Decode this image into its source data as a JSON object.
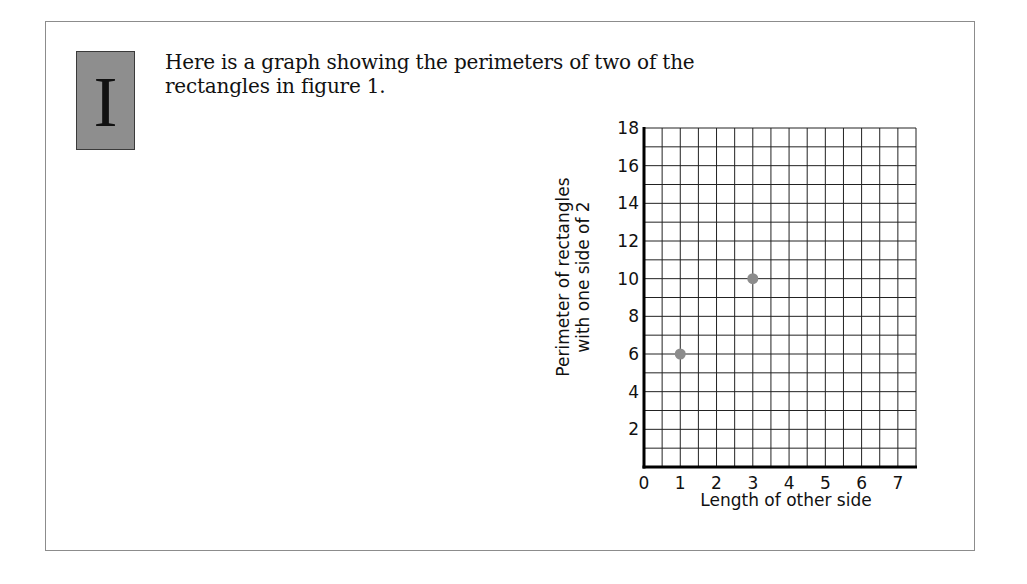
{
  "section": {
    "numeral": "I",
    "intro_lines": [
      "Here is a graph showing the perimeters of two of the",
      "rectangles in figure 1."
    ]
  },
  "colors": {
    "border": "#8c8c8c",
    "numeral_box": "#8e8e8e",
    "grid": "#222222",
    "point": "#8c8c8c"
  },
  "chart_data": {
    "type": "scatter",
    "title": "",
    "xlabel": "Length of other side",
    "ylabel_lines": [
      "Perimeter of rectangles",
      "with one side of 2"
    ],
    "ylabel": "Perimeter of rectangles with one side of 2",
    "xlim": [
      0,
      7.5
    ],
    "ylim": [
      0,
      18
    ],
    "x_ticks": [
      "0",
      "1",
      "2",
      "3",
      "4",
      "5",
      "6",
      "7"
    ],
    "y_ticks": [
      "2",
      "4",
      "6",
      "8",
      "10",
      "12",
      "14",
      "16",
      "18"
    ],
    "grid": true,
    "grid_x_step": 0.5,
    "grid_y_step": 1,
    "series": [
      {
        "name": "Rectangles",
        "points": [
          {
            "x": 1,
            "y": 6
          },
          {
            "x": 3,
            "y": 10
          }
        ]
      }
    ]
  }
}
